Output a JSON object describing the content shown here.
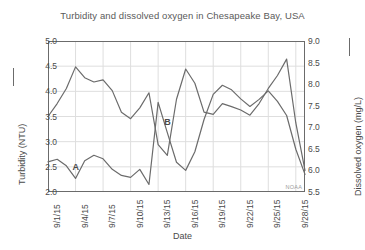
{
  "chart_data": {
    "type": "line",
    "title": "Turbidity and dissolved oxygen in Chesapeake Bay, USA",
    "xlabel": "Date",
    "grid": true,
    "legend": "axis-labels",
    "watermark": "NOAA",
    "x": [
      "9/1/15",
      "9/2/15",
      "9/3/15",
      "9/4/15",
      "9/5/15",
      "9/6/15",
      "9/7/15",
      "9/8/15",
      "9/9/15",
      "9/10/15",
      "9/11/15",
      "9/12/15",
      "9/13/15",
      "9/14/15",
      "9/15/15",
      "9/16/15",
      "9/17/15",
      "9/18/15",
      "9/19/15",
      "9/20/15",
      "9/21/15",
      "9/22/15",
      "9/23/15",
      "9/24/15",
      "9/25/15",
      "9/26/15",
      "9/27/15",
      "9/28/15",
      "9/29/15"
    ],
    "xticks": [
      "9/1/15",
      "9/4/15",
      "9/7/15",
      "9/10/15",
      "9/13/15",
      "9/16/15",
      "9/19/15",
      "9/22/15",
      "9/25/15",
      "9/28/15"
    ],
    "xtick_indices": [
      0,
      3,
      6,
      9,
      12,
      15,
      18,
      21,
      24,
      27
    ],
    "axes": [
      {
        "id": "left",
        "label": "Turbidity (NTU)",
        "unit": "NTU",
        "ylim": [
          2.0,
          5.0
        ],
        "yticks": [
          2.0,
          2.5,
          3.0,
          3.5,
          4.0,
          4.5,
          5.0
        ],
        "yticklabels": [
          "2.0",
          "2.5",
          "3.0",
          "3.5",
          "4.0",
          "4.5",
          "5.0"
        ]
      },
      {
        "id": "right",
        "label": "Dissolved oxygen (mg/L)",
        "unit": "mg/L",
        "ylim": [
          5.5,
          9.0
        ],
        "yticks": [
          5.5,
          6.0,
          6.5,
          7.0,
          7.5,
          8.0,
          8.5,
          9.0
        ],
        "yticklabels": [
          "5.5",
          "6.0",
          "6.5",
          "7.0",
          "7.5",
          "8.0",
          "8.5",
          "9.0"
        ]
      }
    ],
    "series": [
      {
        "name": "Turbidity (NTU)",
        "axis": "left",
        "color": "#6b6b6b",
        "values": [
          2.6,
          2.65,
          2.52,
          2.27,
          2.62,
          2.73,
          2.66,
          2.45,
          2.33,
          2.29,
          2.45,
          2.15,
          3.78,
          3.18,
          2.59,
          2.43,
          2.8,
          3.44,
          3.94,
          4.12,
          4.03,
          3.85,
          3.7,
          3.84,
          4.01,
          3.8,
          3.52,
          2.85,
          2.35
        ]
      },
      {
        "name": "Dissolved oxygen (mg/L)",
        "axis": "right",
        "color": "#6b6b6b",
        "values": [
          7.25,
          7.55,
          7.9,
          8.4,
          8.15,
          8.05,
          8.1,
          7.85,
          7.35,
          7.2,
          7.45,
          7.8,
          6.6,
          6.35,
          7.65,
          8.35,
          8.02,
          7.35,
          7.3,
          7.55,
          7.48,
          7.4,
          7.28,
          7.55,
          7.9,
          8.2,
          8.58,
          7.1,
          6.0
        ]
      }
    ],
    "annotations": [
      {
        "label": "A",
        "x_index": 3,
        "note": "turbidity-peak-A"
      },
      {
        "label": "B",
        "x_index": 13,
        "note": "turbidity-peak-B"
      }
    ]
  }
}
